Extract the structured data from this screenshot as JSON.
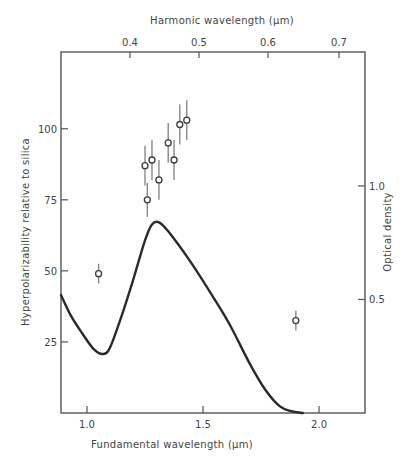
{
  "chart_data": {
    "type": "scatter",
    "title": "",
    "xlabel": "Fundamental wavelength (μm)",
    "x2label": "Harmonic wavelength (μm)",
    "ylabel": "Hyperpolarizability relative to silica",
    "y2label": "Optical density",
    "xlim": [
      0.888,
      2.198
    ],
    "ylim": [
      0,
      127
    ],
    "y2lim": [
      0,
      1.59
    ],
    "x_ticks": [
      1.0,
      1.5,
      2.0
    ],
    "x_tick_labels": [
      "1.0",
      "1.5",
      "2.0"
    ],
    "x2_ticks": [
      0.4,
      0.5,
      0.6,
      0.7
    ],
    "x2_tick_labels": [
      "0.4",
      "0.5",
      "0.6",
      "0.7"
    ],
    "x2_tick_px": [
      130,
      199,
      268,
      339
    ],
    "y_ticks": [
      25,
      50,
      75,
      100
    ],
    "y_tick_labels": [
      "25",
      "50",
      "75",
      "100"
    ],
    "y2_ticks": [
      0.5,
      1.0
    ],
    "y2_tick_labels": [
      "0.5",
      "1.0"
    ],
    "grid": false,
    "legend": null,
    "series": [
      {
        "name": "Hyperpolarizability (measured)",
        "type": "scatter",
        "axis": "left",
        "marker": "open-circle",
        "points": [
          {
            "x": 1.05,
            "y": 49,
            "err": 3.5
          },
          {
            "x": 1.25,
            "y": 87,
            "err": 7
          },
          {
            "x": 1.26,
            "y": 75,
            "err": 6
          },
          {
            "x": 1.28,
            "y": 89,
            "err": 7
          },
          {
            "x": 1.31,
            "y": 82,
            "err": 7
          },
          {
            "x": 1.35,
            "y": 95,
            "err": 7
          },
          {
            "x": 1.375,
            "y": 89,
            "err": 7
          },
          {
            "x": 1.4,
            "y": 101.5,
            "err": 7
          },
          {
            "x": 1.43,
            "y": 103,
            "err": 7
          },
          {
            "x": 1.9,
            "y": 32.5,
            "err": 3.5
          }
        ]
      },
      {
        "name": "Optical density",
        "type": "line",
        "axis": "right",
        "points": [
          {
            "x": 0.888,
            "y": 0.52
          },
          {
            "x": 0.93,
            "y": 0.43
          },
          {
            "x": 0.98,
            "y": 0.35
          },
          {
            "x": 1.03,
            "y": 0.28
          },
          {
            "x": 1.07,
            "y": 0.26
          },
          {
            "x": 1.1,
            "y": 0.29
          },
          {
            "x": 1.15,
            "y": 0.43
          },
          {
            "x": 1.2,
            "y": 0.59
          },
          {
            "x": 1.25,
            "y": 0.76
          },
          {
            "x": 1.28,
            "y": 0.83
          },
          {
            "x": 1.31,
            "y": 0.84
          },
          {
            "x": 1.35,
            "y": 0.8
          },
          {
            "x": 1.45,
            "y": 0.66
          },
          {
            "x": 1.55,
            "y": 0.5
          },
          {
            "x": 1.62,
            "y": 0.38
          },
          {
            "x": 1.7,
            "y": 0.22
          },
          {
            "x": 1.77,
            "y": 0.1
          },
          {
            "x": 1.83,
            "y": 0.03
          },
          {
            "x": 1.88,
            "y": 0.008
          },
          {
            "x": 1.93,
            "y": 0.0
          }
        ]
      }
    ]
  },
  "colors": {
    "axis": "#555555",
    "curve": "#2a2a2a",
    "marker": "#3a3a3a",
    "errorbar": "#888888",
    "text": "#444444"
  }
}
